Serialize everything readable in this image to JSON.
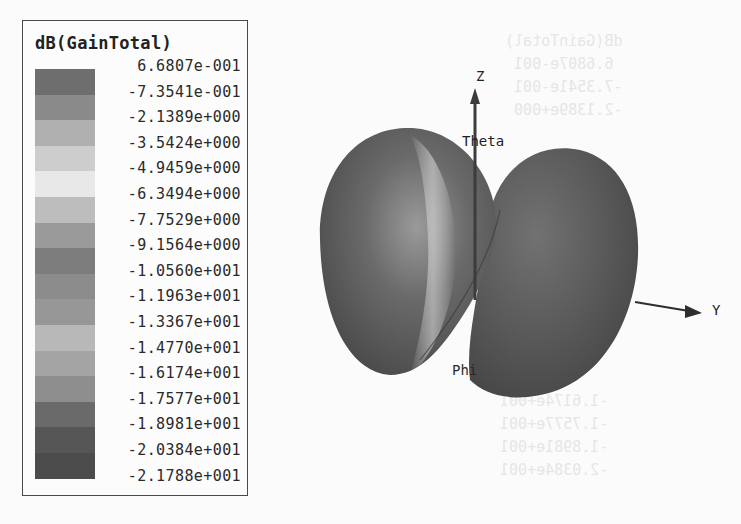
{
  "chart_data": {
    "type": "heatmap",
    "title": "dB(GainTotal)",
    "legend": {
      "title": "dB(GainTotal)",
      "levels": [
        "6.6807e-001",
        "-7.3541e-001",
        "-2.1389e+000",
        "-3.5424e+000",
        "-4.9459e+000",
        "-6.3494e+000",
        "-7.7529e+000",
        "-9.1564e+000",
        "-1.0560e+001",
        "-1.1963e+001",
        "-1.3367e+001",
        "-1.4770e+001",
        "-1.6174e+001",
        "-1.7577e+001",
        "-1.8981e+001",
        "-2.0384e+001",
        "-2.1788e+001"
      ],
      "values": [
        0.66807,
        -0.73541,
        -2.1389,
        -3.5424,
        -4.9459,
        -6.3494,
        -7.7529,
        -9.1564,
        -10.56,
        -11.963,
        -13.367,
        -14.77,
        -16.174,
        -17.577,
        -18.981,
        -20.384,
        -21.788
      ],
      "colors": [
        "#6e6e6e",
        "#8a8a8a",
        "#b0b0b0",
        "#cdcdcd",
        "#e8e8e8",
        "#bdbdbd",
        "#9a9a9a",
        "#7d7d7d",
        "#8c8c8c",
        "#979797",
        "#b8b8b8",
        "#a4a4a4",
        "#8e8e8e",
        "#6a6a6a",
        "#565656",
        "#4c4c4c"
      ]
    },
    "axes": {
      "z": "Z",
      "y": "Y",
      "theta": "Theta",
      "phi": "Phi"
    },
    "range": [
      -21.788,
      0.66807
    ]
  },
  "legend": {
    "title": "dB(GainTotal)"
  },
  "axes": {
    "z": "Z",
    "y": "Y",
    "theta": "Theta",
    "phi": "Phi"
  }
}
